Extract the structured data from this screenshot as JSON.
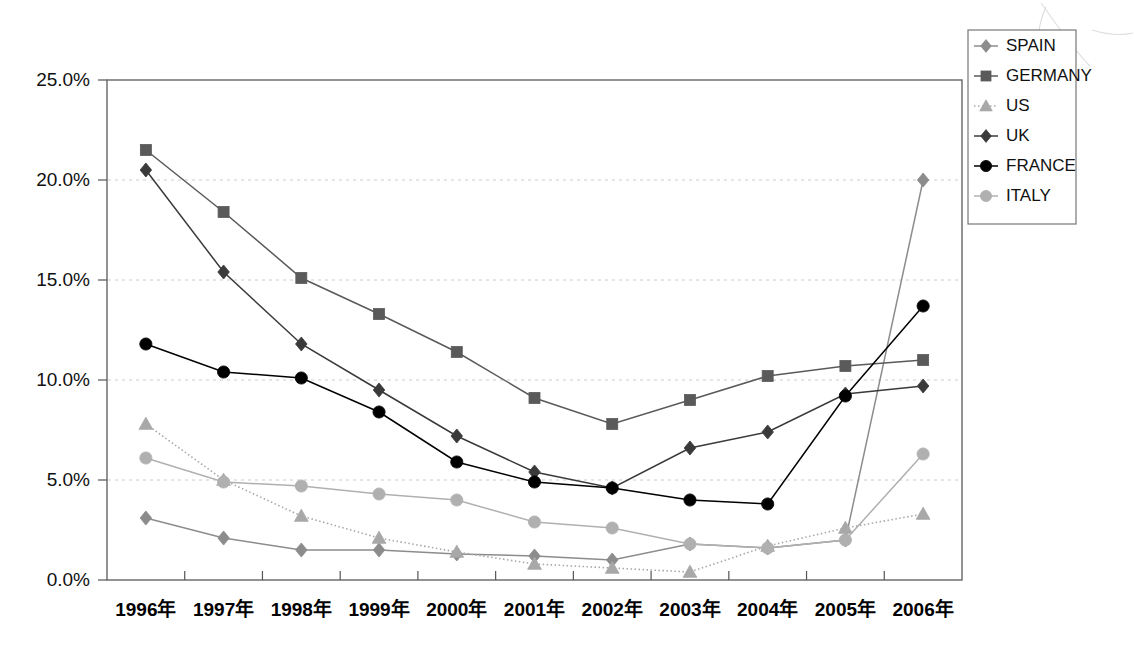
{
  "chart_data": {
    "type": "line",
    "title": "",
    "xlabel": "",
    "ylabel": "",
    "ylim": [
      0,
      25
    ],
    "ytick_labels": [
      "0.0%",
      "5.0%",
      "10.0%",
      "15.0%",
      "20.0%",
      "25.0%"
    ],
    "ytick_values": [
      0,
      5,
      10,
      15,
      20,
      25
    ],
    "grid": true,
    "legend_position": "top-right",
    "categories": [
      "1996年",
      "1997年",
      "1998年",
      "1999年",
      "2000年",
      "2001年",
      "2002年",
      "2003年",
      "2004年",
      "2005年",
      "2006年"
    ],
    "series": [
      {
        "name": "SPAIN",
        "marker": "diamond",
        "color": "#8c8c8c",
        "line_style": "solid",
        "values": [
          3.1,
          2.1,
          1.5,
          1.5,
          1.3,
          1.2,
          1.0,
          1.8,
          1.6,
          2.0,
          20.0
        ]
      },
      {
        "name": "GERMANY",
        "marker": "square",
        "color": "#5a5a5a",
        "line_style": "solid",
        "values": [
          21.5,
          18.4,
          15.1,
          13.3,
          11.4,
          9.1,
          7.8,
          9.0,
          10.2,
          10.7,
          11.0
        ]
      },
      {
        "name": "US",
        "marker": "triangle",
        "color": "#a8a8a8",
        "line_style": "dotted",
        "values": [
          7.8,
          5.0,
          3.2,
          2.1,
          1.4,
          0.8,
          0.6,
          0.4,
          1.7,
          2.6,
          3.3
        ]
      },
      {
        "name": "UK",
        "marker": "diamond",
        "color": "#3a3a3a",
        "line_style": "solid",
        "values": [
          20.5,
          15.4,
          11.8,
          9.5,
          7.2,
          5.4,
          4.6,
          6.6,
          7.4,
          9.3,
          9.7
        ]
      },
      {
        "name": "FRANCE",
        "marker": "circle",
        "color": "#000000",
        "line_style": "solid",
        "values": [
          11.8,
          10.4,
          10.1,
          8.4,
          5.9,
          4.9,
          4.6,
          4.0,
          3.8,
          9.2,
          13.7
        ]
      },
      {
        "name": "ITALY",
        "marker": "circle",
        "color": "#b0b0b0",
        "line_style": "solid",
        "values": [
          6.1,
          4.9,
          4.7,
          4.3,
          4.0,
          2.9,
          2.6,
          1.8,
          1.6,
          2.0,
          6.3
        ]
      }
    ]
  },
  "legend": {
    "items": [
      {
        "label": "SPAIN"
      },
      {
        "label": "GERMANY"
      },
      {
        "label": "US"
      },
      {
        "label": "UK"
      },
      {
        "label": "FRANCE"
      },
      {
        "label": "ITALY"
      }
    ]
  }
}
